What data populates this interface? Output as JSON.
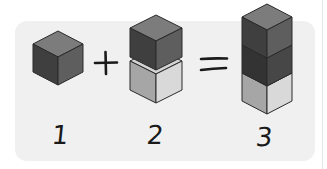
{
  "equation": {
    "operands": [
      {
        "label": "1",
        "cubes": [
          "dark"
        ]
      },
      {
        "label": "2",
        "cubes": [
          "dark",
          "light"
        ]
      },
      {
        "label": "3",
        "cubes": [
          "dark",
          "darker",
          "light"
        ]
      }
    ],
    "operators": [
      "+",
      "="
    ]
  },
  "colors": {
    "panel": "#f0f0f0",
    "cube_dark_top": "#7c7c7c",
    "cube_dark_left": "#3f3f3f",
    "cube_dark_right": "#5e5e5e",
    "cube_darker_top": "#555555",
    "cube_darker_left": "#333333",
    "cube_darker_right": "#474747",
    "cube_light_top": "#d4d4d4",
    "cube_light_left": "#a6a6a6",
    "cube_light_right": "#d9d9d9",
    "outline": "#2a2a2a",
    "ink": "#1a1a1a"
  }
}
